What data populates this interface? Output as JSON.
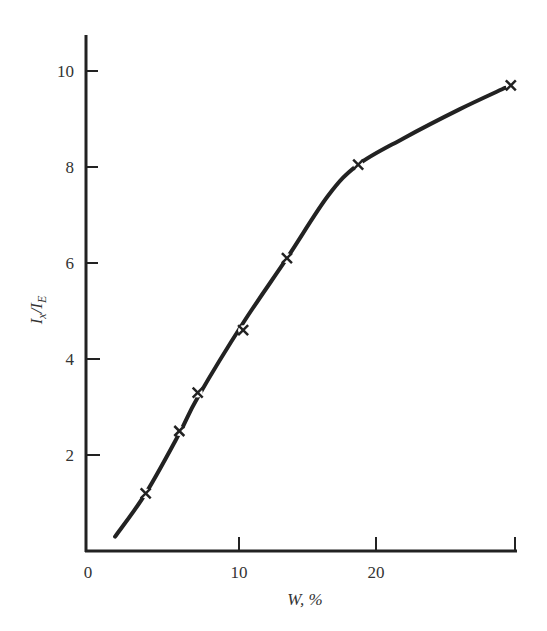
{
  "chart_data": {
    "type": "line",
    "title": "",
    "xlabel": "W, %",
    "ylabel": "Ix/IE",
    "xlim": [
      0,
      30
    ],
    "ylim": [
      0,
      10.8
    ],
    "x_ticks": [
      0,
      10,
      20,
      30
    ],
    "x_tick_labels": [
      "0",
      "10",
      "20",
      ""
    ],
    "y_ticks": [
      2,
      4,
      6,
      8,
      10
    ],
    "y_tick_labels": [
      "2",
      "4",
      "6",
      "8",
      "10"
    ],
    "grid": false,
    "legend": null,
    "series": [
      {
        "name": "measured",
        "marker": "x",
        "points": [
          {
            "x": 3.9,
            "y": 1.2
          },
          {
            "x": 6.1,
            "y": 2.5
          },
          {
            "x": 7.3,
            "y": 3.3
          },
          {
            "x": 10.3,
            "y": 4.6
          },
          {
            "x": 13.5,
            "y": 6.1
          },
          {
            "x": 18.7,
            "y": 8.05
          },
          {
            "x": 29.7,
            "y": 9.7
          }
        ]
      },
      {
        "name": "fitted curve",
        "marker": "none",
        "points": [
          {
            "x": 1.9,
            "y": 0.3
          },
          {
            "x": 3.9,
            "y": 1.2
          },
          {
            "x": 6.1,
            "y": 2.45
          },
          {
            "x": 7.3,
            "y": 3.2
          },
          {
            "x": 10.3,
            "y": 4.75
          },
          {
            "x": 13.5,
            "y": 6.1
          },
          {
            "x": 16.5,
            "y": 7.4
          },
          {
            "x": 18.7,
            "y": 8.05
          },
          {
            "x": 22.0,
            "y": 8.6
          },
          {
            "x": 26.0,
            "y": 9.2
          },
          {
            "x": 29.3,
            "y": 9.65
          }
        ]
      }
    ]
  },
  "labels": {
    "x_axis_title": "W, %",
    "y_axis_main": "I",
    "y_axis_sub1": "x",
    "y_axis_slash": "/I",
    "y_axis_sub2": "E",
    "x_tick_0": "0",
    "x_tick_10": "10",
    "x_tick_20": "20",
    "y_tick_2": "2",
    "y_tick_4": "4",
    "y_tick_6": "6",
    "y_tick_8": "8",
    "y_tick_10": "10"
  }
}
